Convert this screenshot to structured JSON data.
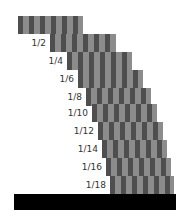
{
  "diagram": {
    "title": "",
    "type": "harmonic block stacking overhang",
    "colors": {
      "stripe_dark": "#4e4e4e",
      "stripe_light": "#8c8c8c",
      "base": "#000000",
      "background": "#ffffff"
    },
    "blocks": [
      {
        "label": "",
        "x": 18,
        "y": 16,
        "w": 65
      },
      {
        "label": "1/2",
        "x": 50,
        "y": 34,
        "w": 66
      },
      {
        "label": "1/4",
        "x": 67,
        "y": 52,
        "w": 65
      },
      {
        "label": "1/6",
        "x": 78,
        "y": 70,
        "w": 65
      },
      {
        "label": "1/8",
        "x": 86,
        "y": 88,
        "w": 65
      },
      {
        "label": "1/10",
        "x": 92,
        "y": 104,
        "w": 65
      },
      {
        "label": "1/12",
        "x": 98,
        "y": 122,
        "w": 65
      },
      {
        "label": "1/14",
        "x": 102,
        "y": 140,
        "w": 65
      },
      {
        "label": "1/16",
        "x": 106,
        "y": 158,
        "w": 65
      },
      {
        "label": "1/18",
        "x": 110,
        "y": 176,
        "w": 64
      }
    ],
    "base": {
      "x": 14,
      "y": 194,
      "w": 162,
      "h": 16
    }
  }
}
